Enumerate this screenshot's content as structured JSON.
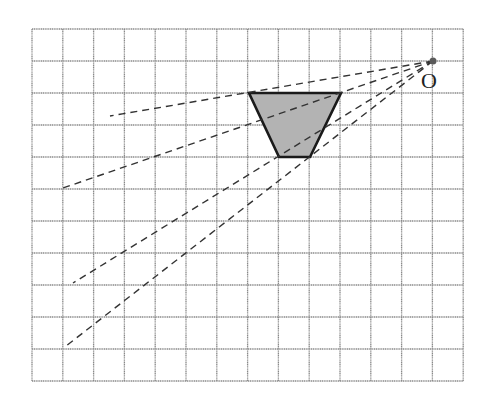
{
  "diagram": {
    "type": "homothety-grid",
    "grid": {
      "left": 32,
      "top": 29,
      "cell_w": 30.8,
      "cell_h": 32,
      "cols": 14,
      "rows": 11,
      "line_color": "#8a8a8a"
    },
    "center": {
      "label": "O",
      "x": 433,
      "y": 61,
      "label_x": 421,
      "label_y": 88,
      "color": "#5a5a5a"
    },
    "trapezoid": {
      "fill": "#b3b3b3",
      "stroke": "#1a1a1a",
      "points": [
        [
          249,
          93
        ],
        [
          341,
          93
        ],
        [
          310,
          157
        ],
        [
          279,
          157
        ]
      ]
    },
    "rays": [
      {
        "from": [
          433,
          61
        ],
        "to": [
          110,
          116
        ]
      },
      {
        "from": [
          433,
          61
        ],
        "to": [
          63,
          188
        ]
      },
      {
        "from": [
          433,
          61
        ],
        "to": [
          73,
          283
        ]
      },
      {
        "from": [
          433,
          61
        ],
        "to": [
          66,
          346
        ]
      }
    ]
  }
}
